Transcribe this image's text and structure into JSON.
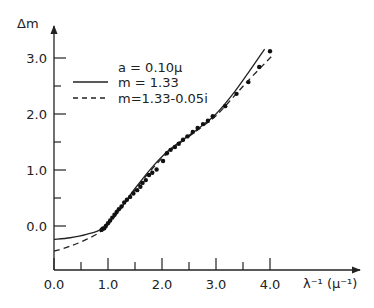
{
  "chart_data": {
    "type": "line",
    "title": "",
    "xlabel": "λ⁻¹ (μ⁻¹)",
    "ylabel": "Δm",
    "xlim": [
      0.0,
      4.0
    ],
    "ylim": [
      -0.8,
      3.3
    ],
    "x_ticks": [
      0.0,
      0.5,
      1.0,
      1.5,
      2.0,
      2.5,
      3.0,
      3.5,
      4.0
    ],
    "x_tick_labels": [
      "0.0",
      "1.0",
      "2.0",
      "3.0",
      "4.0"
    ],
    "y_ticks": [
      0.0,
      0.5,
      1.0,
      1.5,
      2.0,
      2.5,
      3.0
    ],
    "y_tick_labels": [
      "0.0",
      "1.0",
      "2.0",
      "3.0"
    ],
    "grid": false,
    "legend": {
      "position": "upper-left",
      "header": "a = 0.10μ",
      "entries": [
        {
          "label": "m = 1.33",
          "style": "solid"
        },
        {
          "label": "m=1.33-0.05i",
          "style": "dashed"
        }
      ]
    },
    "series": [
      {
        "name": "m = 1.33",
        "style": "solid",
        "x": [
          0.0,
          0.3,
          0.6,
          0.9,
          1.2,
          1.5,
          1.8,
          2.1,
          2.4,
          2.7,
          3.0,
          3.3,
          3.6,
          3.9
        ],
        "y": [
          -0.24,
          -0.21,
          -0.15,
          -0.04,
          0.28,
          0.67,
          1.03,
          1.33,
          1.55,
          1.76,
          2.0,
          2.34,
          2.74,
          3.16
        ]
      },
      {
        "name": "m=1.33-0.05i",
        "style": "dashed",
        "x": [
          0.0,
          0.3,
          0.6,
          0.9,
          1.2,
          1.5,
          1.8,
          2.1,
          2.4,
          2.7,
          3.0,
          3.3,
          3.6,
          4.05
        ],
        "y": [
          -0.45,
          -0.36,
          -0.24,
          -0.07,
          0.26,
          0.64,
          1.0,
          1.3,
          1.53,
          1.74,
          1.97,
          2.28,
          2.6,
          3.05
        ]
      },
      {
        "name": "measured",
        "style": "points",
        "x": [
          0.88,
          0.9,
          0.93,
          0.96,
          1.0,
          1.04,
          1.08,
          1.12,
          1.16,
          1.2,
          1.25,
          1.3,
          1.35,
          1.41,
          1.47,
          1.54,
          1.6,
          1.64,
          1.7,
          1.76,
          1.82,
          1.9,
          2.02,
          2.09,
          2.16,
          2.24,
          2.31,
          2.39,
          2.47,
          2.57,
          2.66,
          2.76,
          2.85,
          2.94,
          3.17,
          3.38,
          3.6,
          3.8,
          4.0
        ],
        "y": [
          -0.07,
          -0.05,
          -0.04,
          0.0,
          0.05,
          0.1,
          0.15,
          0.2,
          0.25,
          0.3,
          0.35,
          0.42,
          0.47,
          0.52,
          0.58,
          0.64,
          0.7,
          0.77,
          0.82,
          0.91,
          0.95,
          1.01,
          1.16,
          1.3,
          1.36,
          1.41,
          1.47,
          1.54,
          1.6,
          1.68,
          1.75,
          1.82,
          1.88,
          1.96,
          2.14,
          2.36,
          2.57,
          2.84,
          3.12
        ]
      }
    ]
  }
}
